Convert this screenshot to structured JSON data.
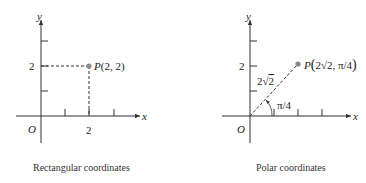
{
  "left_panel": {
    "caption": "Rectangular coordinates",
    "axis_x_label": "x",
    "axis_y_label": "y",
    "origin_label": "O",
    "y_tick_label": "2",
    "x_tick_label": "2",
    "point_label_prefix": "P",
    "point_label_coords": "(2, 2)",
    "point": {
      "x": 2,
      "y": 2
    }
  },
  "right_panel": {
    "caption": "Polar coordinates",
    "axis_x_label": "x",
    "axis_y_label": "y",
    "origin_label": "O",
    "y_tick_label": "2",
    "radius_label_coef": "2",
    "radius_label_sqrt": "2",
    "angle_label": "π/4",
    "point_label_prefix": "P",
    "point_label_r_coef": "2",
    "point_label_r_sqrt": "2",
    "point_label_theta": "π/4",
    "point": {
      "r": "2√2",
      "theta": "π/4"
    }
  },
  "colors": {
    "axis": "#333333",
    "point": "#8a8a8a",
    "text": "#222222"
  }
}
